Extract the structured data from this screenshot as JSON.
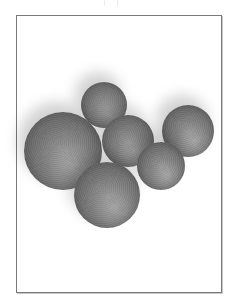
{
  "image": {
    "description": "Grayscale photograph of seven matte spheres of varying sizes clustered together, inside a thin rectangular frame on white background",
    "colors": {
      "background": "#ffffff",
      "frame_border": "#7a7a7a",
      "sphere_mid": "#6e6e6e",
      "sphere_dark": "#3e3e3e"
    },
    "spheres": [
      {
        "name": "top",
        "cx": 104,
        "cy": 105,
        "r": 23
      },
      {
        "name": "large-left",
        "cx": 63,
        "cy": 151,
        "r": 39
      },
      {
        "name": "middle",
        "cx": 128,
        "cy": 141,
        "r": 26
      },
      {
        "name": "right",
        "cx": 188,
        "cy": 131,
        "r": 26
      },
      {
        "name": "lower-right",
        "cx": 161,
        "cy": 166,
        "r": 24
      },
      {
        "name": "bottom",
        "cx": 107,
        "cy": 195,
        "r": 33
      }
    ]
  }
}
